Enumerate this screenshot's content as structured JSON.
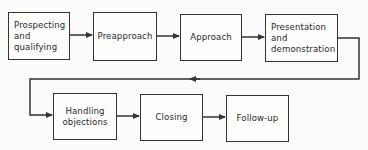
{
  "diagram": {
    "type": "flowchart",
    "title_cropped": true,
    "steps": [
      {
        "id": "prospecting",
        "label": "Prospecting\nand\nqualifying"
      },
      {
        "id": "preapproach",
        "label": "Preapproach"
      },
      {
        "id": "approach",
        "label": "Approach"
      },
      {
        "id": "presentation",
        "label": "Presentation\nand\ndemonstration"
      },
      {
        "id": "handling-objections",
        "label": "Handling\nobjections"
      },
      {
        "id": "closing",
        "label": "Closing"
      },
      {
        "id": "follow-up",
        "label": "Follow-up"
      }
    ],
    "edges": [
      [
        "prospecting",
        "preapproach"
      ],
      [
        "preapproach",
        "approach"
      ],
      [
        "approach",
        "presentation"
      ],
      [
        "presentation",
        "handling-objections"
      ],
      [
        "handling-objections",
        "closing"
      ],
      [
        "closing",
        "follow-up"
      ]
    ],
    "colors": {
      "line": "#333333",
      "background": "#fbfbf9"
    }
  }
}
